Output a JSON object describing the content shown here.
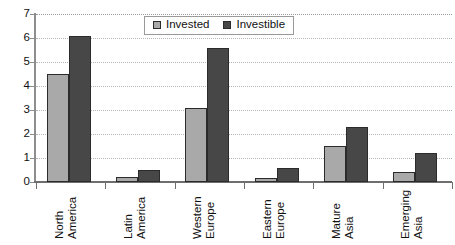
{
  "chart_data": {
    "type": "bar",
    "title": "",
    "subtitle": "",
    "xlabel": "",
    "ylabel": "",
    "categories": [
      "North America",
      "Latin America",
      "Western Europe",
      "Eastern Europe",
      "Mature Asia",
      "Emerging Asia"
    ],
    "category_lines": [
      [
        "North",
        "America"
      ],
      [
        "Latin",
        "America"
      ],
      [
        "Western",
        "Europe"
      ],
      [
        "Eastern",
        "Europe"
      ],
      [
        "Mature",
        "Asia"
      ],
      [
        "Emerging",
        "Asia"
      ]
    ],
    "series": [
      {
        "name": "Invested",
        "color": "#a9a9a9",
        "values": [
          4.5,
          0.2,
          3.1,
          0.15,
          1.5,
          0.4
        ]
      },
      {
        "name": "Investible",
        "color": "#474747",
        "values": [
          6.1,
          0.5,
          5.6,
          0.6,
          2.3,
          1.2
        ]
      }
    ],
    "ylim": [
      0,
      7
    ],
    "ytick_labels": [
      "0",
      "1",
      "2",
      "3",
      "4",
      "5",
      "6",
      "7"
    ],
    "ytick_values": [
      0,
      1,
      2,
      3,
      4,
      5,
      6,
      7
    ],
    "grid": true,
    "grid_style": "dotted-horizontal",
    "legend_position": "top-center",
    "legend_entries": [
      "Invested",
      "Investible"
    ],
    "annotations": [],
    "axis_color": "#8e8e8e",
    "grid_color": "#b4b4b4",
    "label_rotation": -90
  },
  "legend": {
    "items": [
      {
        "label": "Invested",
        "swatch": "invested-swatch"
      },
      {
        "label": "Investible",
        "swatch": "investible-swatch"
      }
    ]
  }
}
